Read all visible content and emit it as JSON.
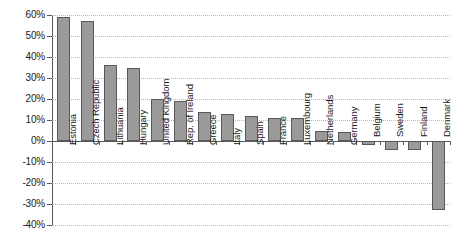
{
  "chart_data": {
    "type": "bar",
    "title": "",
    "subtitle": "",
    "xlabel": "",
    "ylabel": "",
    "ylim": [
      -40,
      60
    ],
    "ytick_step": 10,
    "grid": true,
    "legend": "none",
    "orientation": "vertical",
    "categories": [
      "Estonia",
      "Czech Republic",
      "Lithuania",
      "Hungary",
      "United Kingdom",
      "Rep. of Ireland",
      "Greece",
      "Italy",
      "Spain",
      "France",
      "Luxembourg",
      "Netherlands",
      "Germany",
      "Belgium",
      "Sweden",
      "Finland",
      "Denmark"
    ],
    "values": [
      59,
      57,
      36,
      35,
      20,
      19,
      14,
      13,
      12,
      11,
      11,
      5,
      4.5,
      -2,
      -4.5,
      -4.5,
      -33
    ],
    "value_labels": [
      "59%",
      "57%",
      "36%",
      "35%",
      "20%",
      "19%",
      "14%",
      "13%",
      "12%",
      "11%",
      "11%",
      "5%",
      "4.5%",
      "-2%",
      "-4.5%",
      "-4.5%",
      "-33%"
    ],
    "ytick_labels": [
      "60%",
      "50%",
      "40%",
      "30%",
      "20%",
      "10%",
      "0%",
      "-10%",
      "-20%",
      "-30%",
      "-40%"
    ],
    "ytick_values": [
      60,
      50,
      40,
      30,
      20,
      10,
      0,
      -10,
      -20,
      -30,
      -40
    ],
    "colors": {
      "bar_fill": "#9a9a9a",
      "bar_border": "#595959",
      "gridline": "#b9b9b9",
      "axis": "#5a5a5a",
      "text": "#1a1a1a",
      "background": "#ffffff"
    }
  }
}
